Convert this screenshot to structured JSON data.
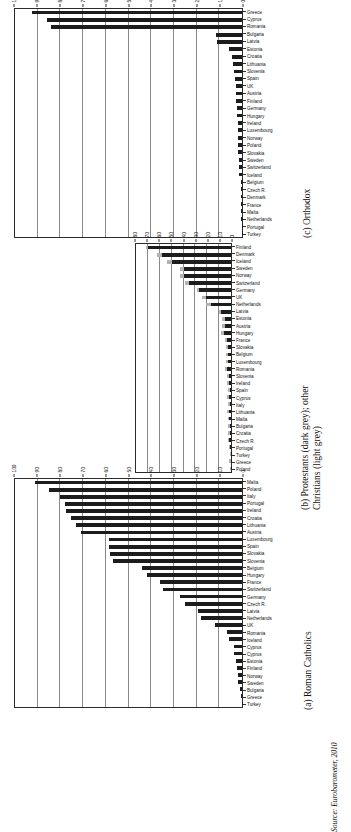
{
  "figure": {
    "source_note": "Source: Eurobarometer, 2010",
    "orientation_note": "page rotated 90 degrees"
  },
  "chart_data": [
    {
      "id": "panel_a",
      "type": "bar",
      "title": "(a) Roman Catholics",
      "xlabel": "",
      "ylabel": "",
      "ylim": [
        0,
        100
      ],
      "yticks": [
        0,
        10,
        20,
        30,
        40,
        50,
        60,
        70,
        80,
        90,
        100
      ],
      "grid": true,
      "legend": "none",
      "categories": [
        "Turkey",
        "Greece",
        "Bulgaria",
        "Sweden",
        "Norway",
        "Finland",
        "Estonia",
        "Cyprus",
        "Cyprus",
        "Iceland",
        "Romania",
        "UK",
        "Netherlands",
        "Latvia",
        "Czech R.",
        "Germany",
        "Switzerland",
        "France",
        "Hungary",
        "Belgium",
        "Slovenia",
        "Slovakia",
        "Spain",
        "Luxembourg",
        "Austria",
        "Lithuania",
        "Croatia",
        "Ireland",
        "Portugal",
        "Italy",
        "Poland",
        "Malta"
      ],
      "values": [
        0.2,
        0.4,
        0.8,
        1.6,
        1.8,
        2.0,
        2.6,
        3.4,
        3.6,
        5.6,
        6.4,
        12.0,
        18.0,
        19.5,
        25.0,
        27.5,
        35.0,
        36.0,
        42.0,
        44.0,
        57.0,
        58.0,
        58.5,
        58.5,
        71.0,
        73.0,
        75.5,
        77.5,
        78.0,
        80.0,
        85.0,
        91.0
      ]
    },
    {
      "id": "panel_b",
      "type": "bar",
      "title": "(b) Protestants (dark grey); other\nChristians (light grey)",
      "xlabel": "",
      "ylabel": "",
      "ylim": [
        0,
        80
      ],
      "yticks": [
        0,
        10,
        20,
        30,
        40,
        50,
        60,
        70,
        80
      ],
      "grid": true,
      "legend": "Protestants (dark grey); other Christians (light grey)",
      "stacked": true,
      "categories": [
        "Poland",
        "Greece",
        "Turkey",
        "Portugal",
        "Czech R.",
        "Croatia",
        "Bulgaria",
        "Malta",
        "Lithuania",
        "Italy",
        "Cyprus",
        "Spain",
        "Ireland",
        "Slovenia",
        "Romania",
        "Luxembourg",
        "Belgium",
        "Slovakia",
        "France",
        "Hungary",
        "Austria",
        "Estonia",
        "Latvia",
        "Netherlands",
        "UK",
        "Germany",
        "Switzerland",
        "Norway",
        "Sweden",
        "Iceland",
        "Denmark",
        "Finland"
      ],
      "series": [
        {
          "name": "Protestants",
          "values": [
            0.2,
            0.3,
            0.4,
            0.6,
            1.6,
            0.8,
            0.8,
            1.8,
            1.8,
            1.2,
            1.6,
            1.0,
            1.8,
            1.6,
            3.4,
            2.2,
            2.6,
            2.6,
            3.6,
            6.0,
            4.8,
            4.8,
            8.6,
            17.0,
            21.0,
            27.0,
            35.0,
            40.0,
            40.0,
            50.0,
            58.0,
            70.0
          ]
        },
        {
          "name": "Other Christians",
          "values": [
            0.4,
            1.2,
            0.6,
            0.8,
            1.2,
            1.4,
            1.4,
            0.6,
            1.2,
            1.6,
            1.8,
            1.4,
            1.2,
            1.8,
            1.6,
            1.8,
            1.6,
            1.6,
            1.8,
            2.4,
            2.4,
            2.6,
            1.6,
            4.0,
            3.4,
            2.0,
            4.0,
            3.0,
            3.0,
            4.0,
            4.0,
            2.0
          ]
        }
      ]
    },
    {
      "id": "panel_c",
      "type": "bar",
      "title": "(c) Orthodox",
      "xlabel": "",
      "ylabel": "",
      "ylim": [
        0,
        100
      ],
      "yticks": [
        0,
        10,
        20,
        30,
        40,
        50,
        60,
        70,
        80,
        90,
        100
      ],
      "grid": true,
      "legend": "none",
      "categories": [
        "Turkey",
        "Portugal",
        "Netherlands",
        "Malta",
        "France",
        "Denmark",
        "Czech R.",
        "Belgium",
        "Iceland",
        "Switzerland",
        "Sweden",
        "Slovakia",
        "Poland",
        "Norway",
        "Luxembourg",
        "Ireland",
        "Hungary",
        "Germany",
        "Finland",
        "Austria",
        "UK",
        "Spain",
        "Slovenia",
        "Lithuania",
        "Croatia",
        "Estonia",
        "Latvia",
        "Bulgaria",
        "Romania",
        "Cyprus",
        "Greece"
      ],
      "values": [
        0.2,
        0.2,
        0.3,
        0.3,
        0.3,
        0.3,
        0.4,
        0.4,
        1.2,
        1.4,
        1.4,
        1.6,
        1.6,
        1.8,
        1.8,
        1.8,
        2.0,
        2.4,
        2.6,
        2.6,
        2.8,
        3.0,
        3.6,
        4.0,
        4.6,
        5.6,
        11.0,
        11.5,
        84.0,
        86.0,
        92.5,
        93.0
      ]
    }
  ]
}
